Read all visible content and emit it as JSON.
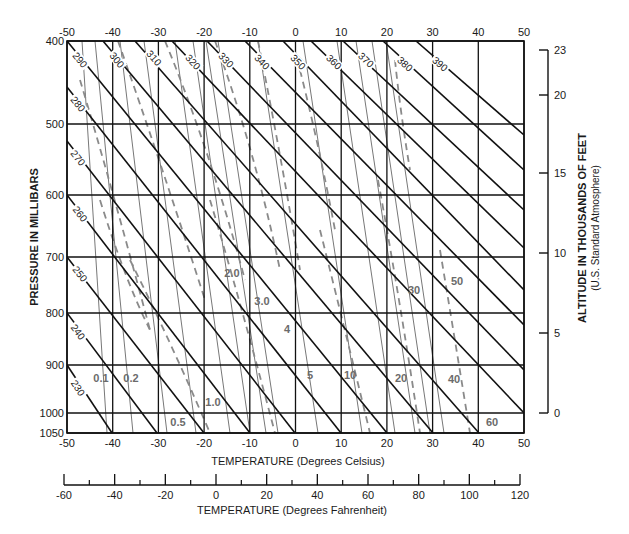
{
  "chart_data": {
    "type": "thermodynamic-diagram",
    "title": "",
    "xlabel": "TEMPERATURE (Degrees Celsius)",
    "xlabel_secondary": "TEMPERATURE (Degrees Fahrenheit)",
    "ylabel": "PRESSURE IN MILLIBARS",
    "ylabel_right": "ALTITUDE IN THOUSANDS OF FEET",
    "ylabel_right_sub": "(U.S. Standard Atmosphere)",
    "xlim_celsius": [
      -50,
      50
    ],
    "celsius_ticks": [
      -50,
      -40,
      -30,
      -20,
      -10,
      0,
      10,
      20,
      30,
      40,
      50
    ],
    "fahrenheit_ticks": [
      -60,
      -40,
      -20,
      0,
      20,
      40,
      60,
      80,
      100,
      120
    ],
    "fahrenheit_minor_ticks": [
      -50,
      -30,
      -10,
      10,
      30,
      50,
      70,
      90,
      110
    ],
    "pressure_ticks_mb": [
      400,
      500,
      600,
      700,
      800,
      900,
      1000,
      1050
    ],
    "altitude_ticks_kft": [
      0,
      5,
      10,
      15,
      20,
      23
    ],
    "dry_adiabats_K": [
      230,
      240,
      250,
      260,
      270,
      280,
      290,
      300,
      310,
      320,
      330,
      340,
      350,
      360,
      370,
      380,
      390
    ],
    "mixing_ratio_lines_g_per_kg": [
      0.1,
      0.2,
      0.5,
      1.0,
      2.0,
      3.0,
      4,
      5,
      10,
      20,
      30,
      40,
      50,
      60
    ],
    "moist_adiabats": "dashed gray curves",
    "grid": true
  },
  "labels": {
    "y_axis": "PRESSURE IN MILLIBARS",
    "y_right_title": "ALTITUDE IN THOUSANDS OF FEET",
    "y_right_subtitle": "(U.S. Standard Atmosphere)",
    "x_celsius": "TEMPERATURE (Degrees Celsius)",
    "x_fahrenheit": "TEMPERATURE (Degrees Fahrenheit)"
  },
  "geometry": {
    "plot": {
      "left": 67,
      "right": 524,
      "top": 41,
      "bottom": 433
    },
    "pressure_y": {
      "400": 41,
      "500": 124,
      "600": 195,
      "700": 257,
      "800": 313,
      "900": 365,
      "1000": 413,
      "1050": 433
    },
    "altitude_y": {
      "0": 413,
      "5": 333,
      "10": 253,
      "15": 173,
      "20": 95,
      "23": 50
    },
    "altitude_axis_x": 548,
    "fahrenheit_axis": {
      "y": 485,
      "x_at_minus60": 64,
      "x_at_120": 520
    }
  },
  "dry_adiabat_lines": [
    {
      "label": "230",
      "x1": 67,
      "y1": 365,
      "x2": 112,
      "y2": 433,
      "lx": 78,
      "ly": 388
    },
    {
      "label": "240",
      "x1": 67,
      "y1": 313,
      "x2": 157,
      "y2": 433,
      "lx": 78,
      "ly": 332
    },
    {
      "label": "250",
      "x1": 67,
      "y1": 257,
      "x2": 204,
      "y2": 433,
      "lx": 80,
      "ly": 274
    },
    {
      "label": "260",
      "x1": 67,
      "y1": 195,
      "x2": 250,
      "y2": 433,
      "lx": 80,
      "ly": 214
    },
    {
      "label": "270",
      "x1": 67,
      "y1": 141,
      "x2": 295,
      "y2": 433,
      "lx": 78,
      "ly": 158
    },
    {
      "label": "280",
      "x1": 67,
      "y1": 87,
      "x2": 341,
      "y2": 433,
      "lx": 78,
      "ly": 104
    },
    {
      "label": "290",
      "x1": 67,
      "y1": 41,
      "x2": 387,
      "y2": 433,
      "lx": 80,
      "ly": 60
    },
    {
      "label": "300",
      "x1": 103,
      "y1": 41,
      "x2": 433,
      "y2": 433,
      "lx": 117,
      "ly": 60
    },
    {
      "label": "310",
      "x1": 135,
      "y1": 41,
      "x2": 479,
      "y2": 433,
      "lx": 154,
      "ly": 58
    },
    {
      "label": "320",
      "x1": 172,
      "y1": 41,
      "x2": 524,
      "y2": 413,
      "lx": 193,
      "ly": 62
    },
    {
      "label": "330",
      "x1": 207,
      "y1": 41,
      "x2": 524,
      "y2": 370,
      "lx": 226,
      "ly": 60
    },
    {
      "label": "340",
      "x1": 245,
      "y1": 41,
      "x2": 524,
      "y2": 325,
      "lx": 262,
      "ly": 62
    },
    {
      "label": "350",
      "x1": 283,
      "y1": 41,
      "x2": 524,
      "y2": 290,
      "lx": 298,
      "ly": 62
    },
    {
      "label": "360",
      "x1": 311,
      "y1": 41,
      "x2": 524,
      "y2": 248,
      "lx": 334,
      "ly": 62
    },
    {
      "label": "370",
      "x1": 343,
      "y1": 41,
      "x2": 524,
      "y2": 210,
      "lx": 366,
      "ly": 60
    },
    {
      "label": "380",
      "x1": 383,
      "y1": 41,
      "x2": 524,
      "y2": 170,
      "lx": 405,
      "ly": 64
    },
    {
      "label": "390",
      "x1": 416,
      "y1": 41,
      "x2": 524,
      "y2": 135,
      "lx": 440,
      "ly": 64
    }
  ],
  "mixing_ratio_label_positions": [
    {
      "label": "0.1",
      "x": 101,
      "y": 382
    },
    {
      "label": "0.2",
      "x": 131,
      "y": 382
    },
    {
      "label": "0.5",
      "x": 178,
      "y": 426
    },
    {
      "label": "1.0",
      "x": 213,
      "y": 406
    },
    {
      "label": "2.0",
      "x": 232,
      "y": 277
    },
    {
      "label": "3.0",
      "x": 262,
      "y": 305
    },
    {
      "label": "4",
      "x": 287,
      "y": 333
    },
    {
      "label": "5",
      "x": 310,
      "y": 379
    },
    {
      "label": "10",
      "x": 350,
      "y": 379
    },
    {
      "label": "20",
      "x": 401,
      "y": 382
    },
    {
      "label": "30",
      "x": 414,
      "y": 294
    },
    {
      "label": "40",
      "x": 454,
      "y": 383
    },
    {
      "label": "50",
      "x": 457,
      "y": 285
    },
    {
      "label": "60",
      "x": 492,
      "y": 426
    }
  ],
  "mixing_ratio_lines": [
    {
      "x1": 82,
      "y1": 41,
      "x2": 107,
      "y2": 433
    },
    {
      "x1": 95,
      "y1": 41,
      "x2": 133,
      "y2": 433
    },
    {
      "x1": 120,
      "y1": 41,
      "x2": 167,
      "y2": 433
    },
    {
      "x1": 144,
      "y1": 41,
      "x2": 196,
      "y2": 433
    },
    {
      "x1": 175,
      "y1": 41,
      "x2": 230,
      "y2": 433
    },
    {
      "x1": 193,
      "y1": 41,
      "x2": 250,
      "y2": 433
    },
    {
      "x1": 206,
      "y1": 41,
      "x2": 266,
      "y2": 433
    },
    {
      "x1": 218,
      "y1": 41,
      "x2": 278,
      "y2": 433
    },
    {
      "x1": 258,
      "y1": 41,
      "x2": 318,
      "y2": 433
    },
    {
      "x1": 303,
      "y1": 41,
      "x2": 362,
      "y2": 433
    },
    {
      "x1": 337,
      "y1": 41,
      "x2": 395,
      "y2": 433
    },
    {
      "x1": 356,
      "y1": 41,
      "x2": 415,
      "y2": 433
    },
    {
      "x1": 372,
      "y1": 41,
      "x2": 430,
      "y2": 433
    },
    {
      "x1": 386,
      "y1": 41,
      "x2": 444,
      "y2": 433
    }
  ],
  "moist_adiabat_curves": [
    "M 80 80 Q 110 180 150 330",
    "M 118 41 Q 160 160 205 300",
    "M 165 41 Q 210 150 245 280",
    "M 215 41 Q 255 150 280 270",
    "M 258 41 Q 280 150 300 270",
    "M 210 200 Q 240 300 275 433",
    "M 130 260 Q 170 340 210 433",
    "M 300 70 Q 320 150 335 230",
    "M 320 230 Q 345 330 370 433",
    "M 378 180 Q 400 300 420 433",
    "M 395 60 Q 400 110 410 170",
    "M 440 250 Q 455 340 470 433",
    "M 100 200 Q 125 280 150 330"
  ]
}
